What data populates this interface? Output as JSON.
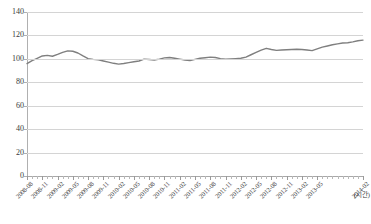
{
  "chart_data": {
    "type": "line",
    "title": "",
    "subtitle": "",
    "xlabel": "(시간)",
    "ylabel": "",
    "ylim": [
      0,
      140
    ],
    "ytick_step": 20,
    "yticks": [
      0,
      20,
      40,
      60,
      80,
      100,
      120,
      140
    ],
    "ytick_labels": [
      "0",
      "20",
      "40",
      "60",
      "80",
      "100",
      "120",
      "140"
    ],
    "grid": true,
    "grid_axis": "y",
    "legend": false,
    "legend_position": "none",
    "line_color": "#7f7f7f",
    "line_width": 1.4,
    "markers": false,
    "x_tick_label_rotation": -45,
    "x_tick_label_interval_months": 3,
    "x": [
      "2008-08",
      "2008-09",
      "2008-10",
      "2008-11",
      "2008-12",
      "2009-01",
      "2009-02",
      "2009-03",
      "2009-04",
      "2009-05",
      "2009-06",
      "2009-07",
      "2009-08",
      "2009-09",
      "2009-10",
      "2009-11",
      "2009-12",
      "2010-01",
      "2010-02",
      "2010-03",
      "2010-04",
      "2010-05",
      "2010-06",
      "2010-07",
      "2010-08",
      "2010-09",
      "2010-10",
      "2010-11",
      "2010-12",
      "2011-01",
      "2011-02",
      "2011-03",
      "2011-04",
      "2011-05",
      "2011-06",
      "2011-07",
      "2011-08",
      "2011-09",
      "2011-10",
      "2011-11",
      "2011-12",
      "2012-01",
      "2012-02",
      "2012-03",
      "2012-04",
      "2012-05",
      "2012-06",
      "2012-07",
      "2012-08",
      "2012-09",
      "2012-10",
      "2012-11",
      "2012-12",
      "2013-01",
      "2013-02",
      "2013-03",
      "2013-04",
      "2013-05",
      "2013-06",
      "2013-07",
      "2013-08",
      "2013-09",
      "2013-10",
      "2013-11",
      "2013-12",
      "2014-01",
      "2014-02"
    ],
    "x_tick_labels": [
      "2008-08",
      "2008-11",
      "2009-02",
      "2009-05",
      "2009-08",
      "2009-11",
      "2010-02",
      "2010-05",
      "2010-08",
      "2010-11",
      "2011-02",
      "2011-05",
      "2011-08",
      "2011-11",
      "2012-02",
      "2012-05",
      "2012-08",
      "2012-11",
      "2013-02",
      "2013-05",
      "2014-02"
    ],
    "values": [
      96.0,
      98.5,
      100.5,
      102.5,
      103.0,
      102.2,
      103.8,
      105.5,
      106.8,
      106.5,
      105.0,
      102.5,
      100.2,
      99.6,
      99.2,
      98.2,
      97.2,
      96.2,
      95.5,
      96.0,
      96.8,
      97.5,
      98.2,
      99.8,
      99.5,
      99.0,
      99.8,
      100.8,
      101.2,
      100.5,
      99.8,
      99.0,
      98.5,
      99.5,
      100.5,
      101.0,
      101.5,
      101.2,
      100.2,
      99.8,
      100.0,
      100.2,
      100.5,
      101.5,
      103.5,
      105.5,
      107.5,
      109.0,
      108.0,
      107.2,
      107.5,
      107.8,
      108.0,
      108.2,
      108.0,
      107.5,
      107.0,
      108.5,
      110.0,
      111.0,
      112.0,
      112.8,
      113.5,
      113.8,
      114.5,
      115.5,
      116.0
    ],
    "series": [
      {
        "name": "지수",
        "color": "#7f7f7f",
        "values": [
          96.0,
          98.5,
          100.5,
          102.5,
          103.0,
          102.2,
          103.8,
          105.5,
          106.8,
          106.5,
          105.0,
          102.5,
          100.2,
          99.6,
          99.2,
          98.2,
          97.2,
          96.2,
          95.5,
          96.0,
          96.8,
          97.5,
          98.2,
          99.8,
          99.5,
          99.0,
          99.8,
          100.8,
          101.2,
          100.5,
          99.8,
          99.0,
          98.5,
          99.5,
          100.5,
          101.0,
          101.5,
          101.2,
          100.2,
          99.8,
          100.0,
          100.2,
          100.5,
          101.5,
          103.5,
          105.5,
          107.5,
          109.0,
          108.0,
          107.2,
          107.5,
          107.8,
          108.0,
          108.2,
          108.0,
          107.5,
          107.0,
          108.5,
          110.0,
          111.0,
          112.0,
          112.8,
          113.5,
          113.8,
          114.5,
          115.5,
          116.0
        ]
      }
    ],
    "annotations": []
  }
}
